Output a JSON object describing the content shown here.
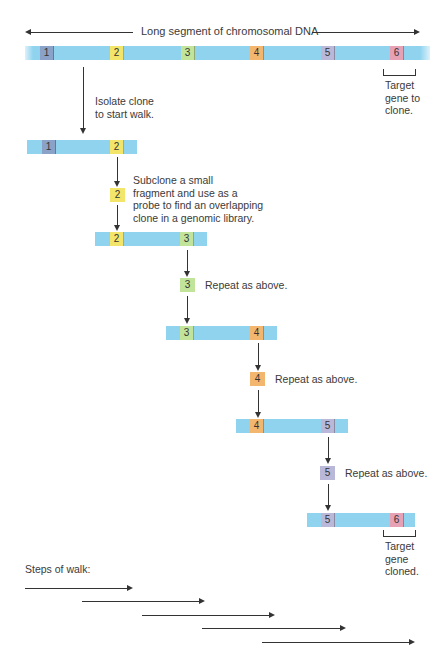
{
  "title": "Long segment of chromosomal DNA",
  "colors": {
    "dna": "#8fd3ef",
    "marker_1": "#8aa2c8",
    "marker_2": "#f3e56a",
    "marker_3": "#c2e39a",
    "marker_4": "#f2b66e",
    "marker_5": "#b9b8d9",
    "marker_6": "#e6a1b4"
  },
  "main_dna": {
    "markers": [
      "1",
      "2",
      "3",
      "4",
      "5",
      "6"
    ],
    "target_label": "Target\ngene to\nclone."
  },
  "steps": {
    "isolate": "Isolate clone\nto start walk.",
    "subclone": "Subclone a small\nfragment and use as a\nprobe to find an overlapping\nclone in a genomic library.",
    "repeat_3": "Repeat as above.",
    "repeat_4": "Repeat as above.",
    "repeat_5": "Repeat as above."
  },
  "clones": [
    {
      "left": "1",
      "right": "2"
    },
    {
      "left": "2",
      "right": "3"
    },
    {
      "left": "3",
      "right": "4"
    },
    {
      "left": "4",
      "right": "5"
    },
    {
      "left": "5",
      "right": "6"
    }
  ],
  "probes": [
    "2",
    "3",
    "4",
    "5"
  ],
  "final": {
    "target_label": "Target\ngene\ncloned."
  },
  "walk": {
    "label": "Steps of walk:",
    "step_count": 5
  }
}
